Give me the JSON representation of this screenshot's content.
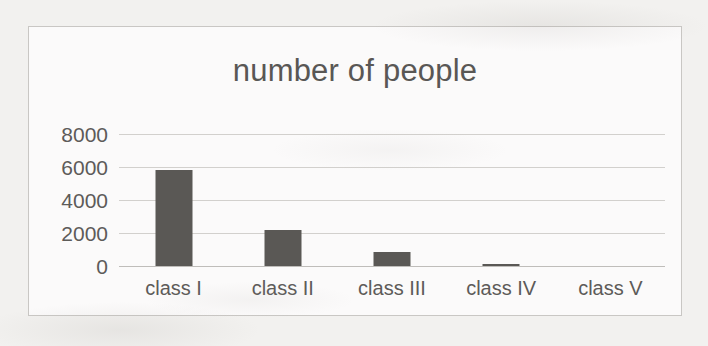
{
  "chart_data": {
    "type": "bar",
    "title": "number of people",
    "xlabel": "",
    "ylabel": "",
    "categories": [
      "class I",
      "class II",
      "class III",
      "class IV",
      "class V"
    ],
    "values": [
      5800,
      2200,
      850,
      150,
      0
    ],
    "ylim": [
      0,
      8000
    ],
    "yticks": [
      0,
      2000,
      4000,
      6000,
      8000
    ],
    "ytick_labels": [
      "0",
      "2000",
      "4000",
      "6000",
      "8000"
    ],
    "grid": true,
    "legend": false,
    "legend_position": "none",
    "bar_color": "#5a5855",
    "gridline_color": "#d2d0cd",
    "text_color": "#5d5b59",
    "plot_background": "#fbfafa",
    "border_color": "#c9c7c4"
  }
}
